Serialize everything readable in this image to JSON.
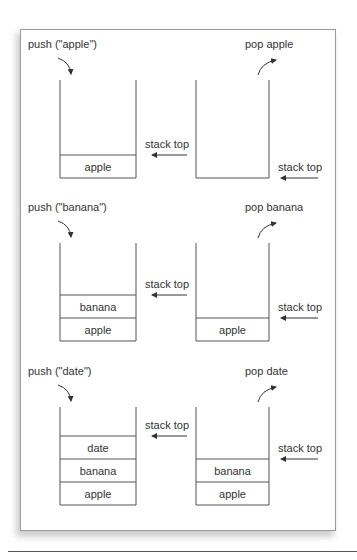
{
  "colors": {
    "line": "#555555",
    "text": "#333333",
    "frame_border": "#9a9a9a"
  },
  "rows": [
    {
      "push": {
        "label": "push (\"apple\")",
        "items": [
          "apple"
        ],
        "pointer_label": "stack top"
      },
      "pop": {
        "label": "pop apple",
        "items": [],
        "pointer_label": "stack top"
      }
    },
    {
      "push": {
        "label": "push (\"banana\")",
        "items": [
          "apple",
          "banana"
        ],
        "pointer_label": "stack top"
      },
      "pop": {
        "label": "pop banana",
        "items": [
          "apple"
        ],
        "pointer_label": "stack top"
      }
    },
    {
      "push": {
        "label": "push (\"date\")",
        "items": [
          "apple",
          "banana",
          "date"
        ],
        "pointer_label": "stack top"
      },
      "pop": {
        "label": "pop date",
        "items": [
          "apple",
          "banana"
        ],
        "pointer_label": "stack top"
      }
    }
  ]
}
